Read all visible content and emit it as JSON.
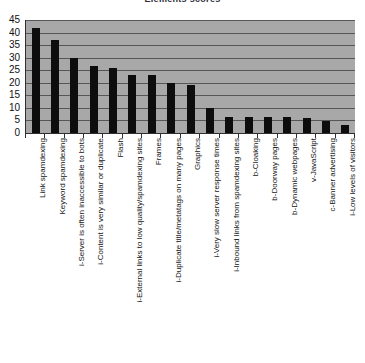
{
  "chart_data": {
    "type": "bar",
    "title": "Elements scores",
    "xlabel": "",
    "ylabel": "",
    "ylim": [
      0,
      45
    ],
    "y_ticks": [
      0,
      5,
      10,
      15,
      20,
      25,
      30,
      35,
      40,
      45
    ],
    "grid": true,
    "legend": "none",
    "bar_color": "#0d0d0d",
    "plot_background": "#a8a8a8",
    "categories": [
      "Link spamdexing",
      "Keyword spamdexing",
      "i-Server is often inaccessible to bots",
      "i-Content is very similar or duplicate",
      "Flash",
      "i-External links to low quality/spamdexing sites",
      "Frames",
      "i-Duplicate title/metatags on many pages",
      "Graphics",
      "i-Very slow server response times",
      "i-Inbound links from spamdexing sites",
      "b-Cloaking",
      "b-Doorway pages",
      "b-Dynamic webpages",
      "v-JavaScript",
      "c-Banner advertising",
      "i-Low levels of visitors"
    ],
    "values": [
      42,
      37,
      30,
      26.5,
      26,
      23.3,
      23,
      19.8,
      19.3,
      10,
      6.3,
      6.3,
      6.3,
      6.3,
      6,
      4.7,
      3
    ],
    "series": [
      {
        "name": "Elements scores",
        "values": [
          42,
          37,
          30,
          26.5,
          26,
          23.3,
          23,
          19.8,
          19.3,
          10,
          6.3,
          6.3,
          6.3,
          6.3,
          6,
          4.7,
          3
        ]
      }
    ]
  }
}
